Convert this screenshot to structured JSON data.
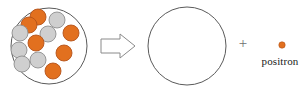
{
  "diagram": {
    "canvas": {
      "width": 306,
      "height": 91,
      "background": "#ffffff"
    },
    "colors": {
      "proton_fill": "#E2701F",
      "proton_stroke": "#B4521A",
      "neutron_fill": "#CFCFCF",
      "neutron_stroke": "#8E8E8E",
      "outline": "#5A5A5A",
      "arrow_stroke": "#8A8A8A",
      "plus_color": "#6F6F6F",
      "text_color": "#1A1A1A"
    },
    "parent_nucleus": {
      "label": "parent-nucleus",
      "center": {
        "x": 49,
        "y": 46
      },
      "radius": 38,
      "particles": [
        {
          "type": "proton",
          "cx": 38,
          "cy": 17,
          "r": 8
        },
        {
          "type": "proton",
          "cx": 29,
          "cy": 25,
          "r": 8
        },
        {
          "type": "neutron",
          "cx": 57,
          "cy": 20,
          "r": 8
        },
        {
          "type": "neutron",
          "cx": 20,
          "cy": 33,
          "r": 8
        },
        {
          "type": "neutron",
          "cx": 48,
          "cy": 34,
          "r": 8
        },
        {
          "type": "proton",
          "cx": 71,
          "cy": 33,
          "r": 8
        },
        {
          "type": "proton",
          "cx": 36,
          "cy": 43,
          "r": 8
        },
        {
          "type": "neutron",
          "cx": 19,
          "cy": 50,
          "r": 8
        },
        {
          "type": "proton",
          "cx": 64,
          "cy": 53,
          "r": 8
        },
        {
          "type": "neutron",
          "cx": 38,
          "cy": 60,
          "r": 8
        },
        {
          "type": "neutron",
          "cx": 22,
          "cy": 64,
          "r": 8
        },
        {
          "type": "proton",
          "cx": 53,
          "cy": 71,
          "r": 8
        }
      ],
      "counts": {
        "protons": 6,
        "neutrons": 6,
        "total": 12
      }
    },
    "arrow": {
      "label": "yields-arrow",
      "direction": "right",
      "x": 101,
      "y": 35,
      "width": 34,
      "height": 22
    },
    "daughter_nucleus": {
      "label": "daughter-nucleus",
      "center": {
        "x": 187,
        "y": 46
      },
      "radius": 39,
      "particles": [],
      "counts": {
        "protons": 0,
        "neutrons": 0,
        "total": 0
      }
    },
    "plus": {
      "symbol": "+",
      "x": 236,
      "y": 36
    },
    "positron": {
      "label": "positron",
      "dot": {
        "cx": 282,
        "cy": 45,
        "r": 3.2
      }
    }
  }
}
